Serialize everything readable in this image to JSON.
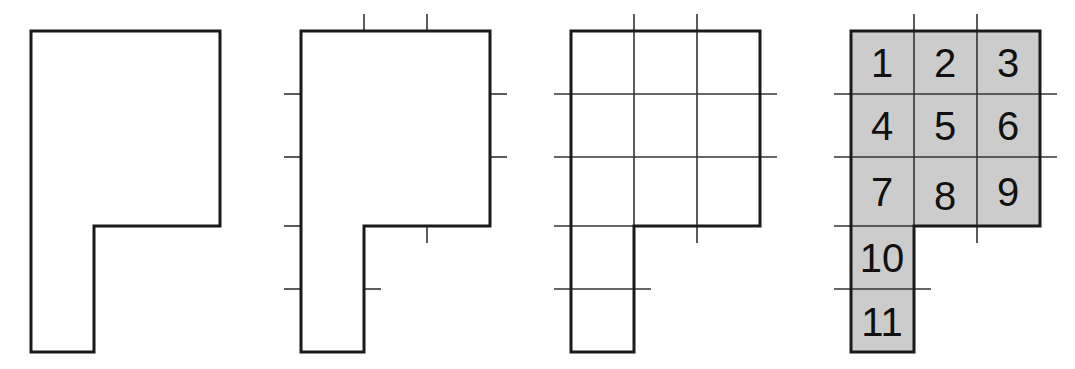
{
  "figure": {
    "panel_count": 4,
    "unit_size_px": 63,
    "shape": {
      "name": "P-shaped polygon",
      "description": "A 3-by-3 square block with a 1-by-2 leg extending down from the left column",
      "grid_columns": 3,
      "grid_rows": 5,
      "occupied_cells": [
        [
          0,
          0
        ],
        [
          1,
          0
        ],
        [
          2,
          0
        ],
        [
          0,
          1
        ],
        [
          1,
          1
        ],
        [
          2,
          1
        ],
        [
          0,
          2
        ],
        [
          1,
          2
        ],
        [
          2,
          2
        ],
        [
          0,
          3
        ],
        [
          0,
          4
        ]
      ],
      "total_unit_squares": 11,
      "outline_points": "0,0 3,0 3,3 1,3 1,5 0,5"
    },
    "panels": [
      {
        "id": "panel-outline",
        "label": "outline only",
        "show_outline": true,
        "show_ticks": false,
        "show_grid": false,
        "show_fill": false,
        "show_numbers": false
      },
      {
        "id": "panel-ticks",
        "label": "outline with unit tick marks",
        "show_outline": true,
        "show_ticks": true,
        "show_grid": false,
        "show_fill": false,
        "show_numbers": false
      },
      {
        "id": "panel-grid",
        "label": "outline with grid lines",
        "show_outline": true,
        "show_ticks": true,
        "show_grid": true,
        "show_fill": false,
        "show_numbers": false
      },
      {
        "id": "panel-numbered",
        "label": "shaded unit squares numbered 1 to 11",
        "show_outline": true,
        "show_ticks": true,
        "show_grid": true,
        "show_fill": true,
        "show_numbers": true
      }
    ],
    "cell_numbers": [
      {
        "n": "1",
        "col": 0,
        "row": 0
      },
      {
        "n": "2",
        "col": 1,
        "row": 0
      },
      {
        "n": "3",
        "col": 2,
        "row": 0
      },
      {
        "n": "4",
        "col": 0,
        "row": 1
      },
      {
        "n": "5",
        "col": 1,
        "row": 1
      },
      {
        "n": "6",
        "col": 2,
        "row": 1
      },
      {
        "n": "7",
        "col": 0,
        "row": 2
      },
      {
        "n": "8",
        "col": 1,
        "row": 2
      },
      {
        "n": "9",
        "col": 2,
        "row": 2
      },
      {
        "n": "10",
        "col": 0,
        "row": 3
      },
      {
        "n": "11",
        "col": 0,
        "row": 4
      }
    ],
    "colors": {
      "background": "#ffffff",
      "outline": "#1a1a1a",
      "grid_line": "#333333",
      "tick_mark": "#333333",
      "fill": "#cccccc",
      "number_text": "#111111"
    },
    "panel_offsets_px": [
      31,
      301,
      571,
      851
    ],
    "geometry_px": {
      "origin_y": 31,
      "unit": 63,
      "outline_stroke": 3,
      "grid_stroke": 1.6,
      "tick_stroke": 1.6,
      "tick_overhang": 17
    }
  }
}
